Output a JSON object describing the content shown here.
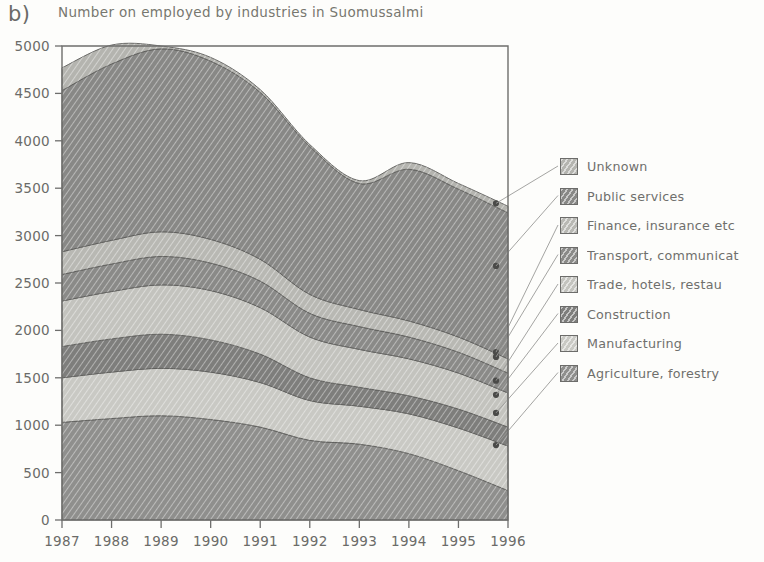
{
  "panel": {
    "letter": "b)"
  },
  "chart_data": {
    "type": "area",
    "stacked": true,
    "title": "Number on employed by industries in Suomussalmi",
    "xlabel": "",
    "ylabel": "",
    "x": [
      1987,
      1988,
      1989,
      1990,
      1991,
      1992,
      1993,
      1994,
      1995,
      1996
    ],
    "categories": [
      "1987",
      "1988",
      "1989",
      "1990",
      "1991",
      "1992",
      "1993",
      "1994",
      "1995",
      "1996"
    ],
    "xlim": [
      1987,
      1996
    ],
    "ylim": [
      0,
      5000
    ],
    "yticks": [
      0,
      500,
      1000,
      1500,
      2000,
      2500,
      3000,
      3500,
      4000,
      4500,
      5000
    ],
    "ytick_labels": [
      "0",
      "500",
      "1000",
      "1500",
      "2000",
      "2500",
      "3000",
      "3500",
      "4000",
      "4500",
      "5000"
    ],
    "grid": false,
    "legend_position": "right",
    "stack_order_bottom_to_top": [
      "Agriculture, forestry",
      "Manufacturing",
      "Construction",
      "Trade, hotels, restau",
      "Transport, communicat",
      "Finance, insurance etc",
      "Public services",
      "Unknown"
    ],
    "series": [
      {
        "name": "Agriculture, forestry",
        "color": "#8f8f8d",
        "values": [
          1030,
          1070,
          1100,
          1060,
          980,
          840,
          800,
          700,
          520,
          310
        ]
      },
      {
        "name": "Manufacturing",
        "color": "#c9c9c4",
        "values": [
          470,
          490,
          500,
          500,
          470,
          420,
          400,
          420,
          450,
          470
        ]
      },
      {
        "name": "Construction",
        "color": "#7e7e7c",
        "values": [
          330,
          350,
          360,
          340,
          300,
          240,
          200,
          190,
          200,
          200
        ]
      },
      {
        "name": "Trade, hotels, restau",
        "color": "#c3c3be",
        "values": [
          480,
          500,
          520,
          520,
          490,
          430,
          400,
          390,
          380,
          360
        ]
      },
      {
        "name": "Transport, communicat",
        "color": "#8a8a88",
        "values": [
          280,
          290,
          300,
          290,
          280,
          250,
          240,
          230,
          220,
          210
        ]
      },
      {
        "name": "Finance, insurance etc",
        "color": "#b8b8b3",
        "values": [
          240,
          250,
          260,
          250,
          230,
          200,
          180,
          170,
          160,
          150
        ]
      },
      {
        "name": "Public services",
        "color": "#888886",
        "values": [
          1700,
          1860,
          1930,
          1880,
          1760,
          1560,
          1330,
          1600,
          1560,
          1540
        ]
      },
      {
        "name": "Unknown",
        "color": "#b4b4af",
        "values": [
          240,
          200,
          30,
          40,
          30,
          20,
          30,
          70,
          60,
          70
        ]
      }
    ],
    "endpoint_markers_1996": [
      3340,
      2680,
      1770,
      1720,
      1470,
      1320,
      1130,
      790,
      310
    ]
  },
  "legend": {
    "items": [
      {
        "label": "Unknown",
        "color": "#b4b4af"
      },
      {
        "label": "Public services",
        "color": "#888886"
      },
      {
        "label": "Finance, insurance etc",
        "color": "#b8b8b3"
      },
      {
        "label": "Transport, communicat",
        "color": "#8a8a88"
      },
      {
        "label": "Trade, hotels, restau",
        "color": "#c3c3be"
      },
      {
        "label": "Construction",
        "color": "#7e7e7c"
      },
      {
        "label": "Manufacturing",
        "color": "#c9c9c4"
      },
      {
        "label": "Agriculture, forestry",
        "color": "#8f8f8d"
      }
    ]
  }
}
